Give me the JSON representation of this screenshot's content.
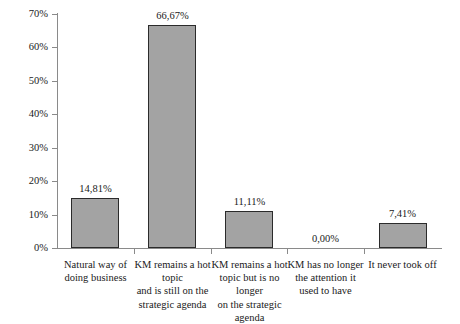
{
  "chart_data": {
    "type": "bar",
    "title": "",
    "subtitle": "",
    "xlabel": "",
    "ylabel": "",
    "ylim": [
      0,
      70
    ],
    "grid": false,
    "legend": null,
    "decimal_separator": ",",
    "value_suffix": "%",
    "bar_color": "#a3a3a3",
    "bar_border_color": "#2b2b2b",
    "axis_color": "#8a8a8a",
    "categories": [
      "Natural way of doing business",
      "KM remains a hot topic and is still on the strategic agenda",
      "KM remains a hot topic but is no longer on the strategic agenda",
      "KM has no longer the attention it used to have",
      "It never took off"
    ],
    "category_lines": [
      [
        "Natural way of",
        "doing business"
      ],
      [
        "KM remains a hot topic",
        "and is still on the",
        "strategic agenda"
      ],
      [
        "KM remains a hot",
        "topic but is no longer",
        "on the strategic agenda"
      ],
      [
        "KM has no longer",
        "the attention it",
        "used to have"
      ],
      [
        "It never took off"
      ]
    ],
    "values": [
      14.81,
      66.67,
      11.11,
      0.0,
      7.41
    ],
    "value_labels": [
      "14,81%",
      "66,67%",
      "11,11%",
      "0,00%",
      "7,41%"
    ],
    "yticks": [
      0,
      10,
      20,
      30,
      40,
      50,
      60,
      70
    ],
    "ytick_labels": [
      "0%",
      "10%",
      "20%",
      "30%",
      "40%",
      "50%",
      "60%",
      "70%"
    ]
  }
}
